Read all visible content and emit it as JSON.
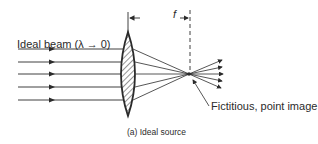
{
  "figure": {
    "beam_label": "Ideal beam (λ → 0)",
    "focal_length_label": "f",
    "point_label": "Fictitious, point image",
    "caption": "(a)  Ideal source"
  },
  "colors": {
    "ink": "#2b2b2b",
    "background": "#ffffff"
  }
}
